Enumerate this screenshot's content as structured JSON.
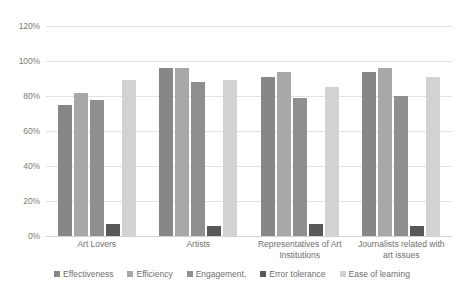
{
  "chart_data": {
    "type": "bar",
    "title": "",
    "subtitle": "",
    "xlabel": "",
    "ylabel": "",
    "ylim": [
      0,
      120
    ],
    "y_ticks": [
      "0%",
      "20%",
      "40%",
      "60%",
      "80%",
      "100%",
      "120%"
    ],
    "y_tick_values": [
      0,
      20,
      40,
      60,
      80,
      100,
      120
    ],
    "grid": true,
    "legend_position": "bottom",
    "categories": [
      "Art Lovers",
      "Artists",
      "Representatives of Art Institutions",
      "Journalists related with art issues"
    ],
    "series": [
      {
        "name": "Effectiveness",
        "color": "#878787",
        "values": [
          75,
          96,
          91,
          94
        ]
      },
      {
        "name": "Efficiency",
        "color": "#a8a8a8",
        "values": [
          82,
          96,
          94,
          96
        ]
      },
      {
        "name": "Engagement,",
        "color": "#8f8f8f",
        "values": [
          78,
          88,
          79,
          80
        ]
      },
      {
        "name": "Error tolerance",
        "color": "#585858",
        "values": [
          7,
          6,
          7,
          6
        ]
      },
      {
        "name": "Ease of learning",
        "color": "#d2d2d2",
        "values": [
          89,
          89,
          85,
          91
        ]
      }
    ]
  },
  "colors": {
    "background": "#ffffff",
    "gridline": "#e2e2e2",
    "axis_text": "#7b7b7b",
    "label_text": "#6f6f6f"
  }
}
